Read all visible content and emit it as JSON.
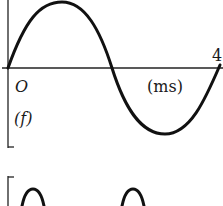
{
  "figure_top": {
    "origin_label": "O",
    "unit_label": "(ms)",
    "tick_label": "4",
    "panel_label": "(f)",
    "waveform": "sine",
    "period_ms": 4,
    "x_range_ms": [
      0,
      4
    ]
  },
  "figure_bottom": {
    "waveform": "full-wave rectified / periodic humps",
    "visible_peaks": 2
  },
  "colors": {
    "stroke": "#111111",
    "background": "#ffffff"
  }
}
